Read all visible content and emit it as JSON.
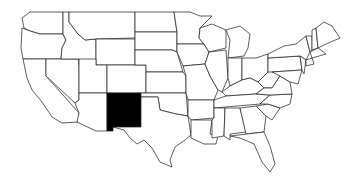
{
  "map": {
    "type": "us-states-choropleth",
    "highlighted_states": [
      "New Mexico"
    ],
    "colors": {
      "background": "#ffffff",
      "state_fill": "#ffffff",
      "highlight_fill": "#000000",
      "border": "#1a1a1a"
    }
  }
}
